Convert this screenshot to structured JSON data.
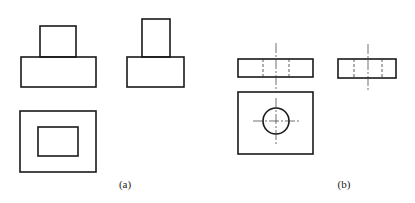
{
  "figures": [
    {
      "id": "a",
      "label": "(a)",
      "views": {
        "front": {
          "base": [
            21,
            57,
            75,
            30
          ],
          "top_block": [
            40,
            26,
            36,
            31
          ]
        },
        "side": {
          "base": [
            127,
            57,
            57,
            30
          ],
          "top_block": [
            142,
            19,
            28,
            38
          ]
        },
        "plan": {
          "outer": [
            20,
            111,
            76,
            61
          ],
          "inner": [
            38,
            127,
            40,
            29
          ]
        }
      }
    },
    {
      "id": "b",
      "label": "(b)",
      "views": {
        "front": {
          "rect": [
            238,
            59,
            75,
            18
          ],
          "hidden_x": [
            263,
            289
          ],
          "centerline_x": 276
        },
        "side": {
          "rect": [
            338,
            59,
            58,
            19
          ],
          "hidden_x": [
            354,
            382
          ],
          "centerline_x": 368
        },
        "plan": {
          "rect": [
            238,
            92,
            75,
            62
          ],
          "hole": {
            "cx": 276,
            "cy": 121,
            "r": 13
          }
        }
      }
    }
  ]
}
